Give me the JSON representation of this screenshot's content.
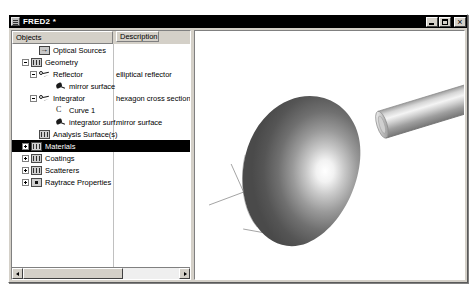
{
  "window": {
    "title": "FRED2 *",
    "sys_icon": "window-menu-icon",
    "buttons": {
      "minimize": "minimize-icon",
      "maximize": "maximize-icon",
      "close": "close-icon"
    }
  },
  "tree": {
    "columns": {
      "objects": "Objects",
      "description": "Description"
    },
    "rows": [
      {
        "label": "Optical Sources",
        "desc": "",
        "indent": 2,
        "expander": "none",
        "icon": "arrow-into-box-icon",
        "selected": false
      },
      {
        "label": "Geometry",
        "desc": "",
        "indent": 1,
        "expander": "minus",
        "icon": "grid-box-icon",
        "selected": false
      },
      {
        "label": "Reflector",
        "desc": "elliptical reflector",
        "indent": 2,
        "expander": "minus",
        "icon": "key-icon",
        "selected": false
      },
      {
        "label": "mirror surface",
        "desc": "",
        "indent": 4,
        "expander": "none",
        "icon": "surface-leaf-icon",
        "selected": false
      },
      {
        "label": "Integrator",
        "desc": "hexagon cross section",
        "indent": 2,
        "expander": "minus",
        "icon": "key-icon",
        "selected": false
      },
      {
        "label": "Curve 1",
        "desc": "",
        "indent": 4,
        "expander": "none",
        "icon": "curve-icon",
        "selected": false
      },
      {
        "label": "integrator surf.",
        "desc": "mirror surface",
        "indent": 4,
        "expander": "none",
        "icon": "surface-leaf-icon",
        "selected": false
      },
      {
        "label": "Analysis Surface(s)",
        "desc": "",
        "indent": 2,
        "expander": "none",
        "icon": "grid-box-icon",
        "selected": false
      },
      {
        "label": "Materials",
        "desc": "",
        "indent": 1,
        "expander": "plus",
        "icon": "grid-box-icon",
        "selected": true
      },
      {
        "label": "Coatings",
        "desc": "",
        "indent": 1,
        "expander": "plus",
        "icon": "grid-box-icon",
        "selected": false
      },
      {
        "label": "Scatterers",
        "desc": "",
        "indent": 1,
        "expander": "plus",
        "icon": "grid-box-icon",
        "selected": false
      },
      {
        "label": "Raytrace Properties",
        "desc": "",
        "indent": 1,
        "expander": "plus",
        "icon": "dot-box-icon",
        "selected": false
      }
    ],
    "hscrollbar": {
      "left_arrow": "scroll-left-icon",
      "right_arrow": "scroll-right-icon",
      "thumb": "scroll-thumb"
    }
  },
  "viewport": {
    "name": "3d-model-view",
    "objects": [
      {
        "name": "elliptical-reflector-dome",
        "kind": "shaded-ellipsoid-dome"
      },
      {
        "name": "integrator-rod-cylinder",
        "kind": "shaded-cylinder"
      },
      {
        "name": "optical-axis-lines",
        "kind": "wireframe-axis"
      }
    ],
    "colors": {
      "background": "#ffffff",
      "dome_dark": "#4a4a4a",
      "dome_mid": "#8c8c8c",
      "dome_highlight": "#ffffff",
      "cylinder_light": "#e8e8e8",
      "cylinder_mid": "#b5b5b5",
      "cylinder_dark": "#6e6e6e",
      "line": "#909090"
    }
  }
}
